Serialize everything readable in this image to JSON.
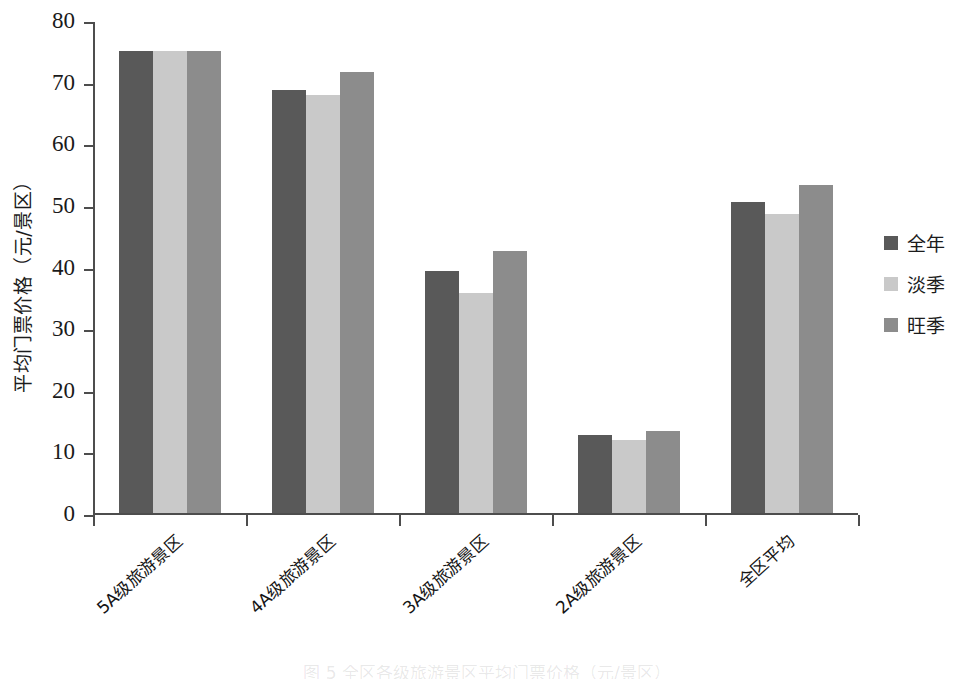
{
  "chart_data": {
    "type": "bar",
    "title": "",
    "xlabel": "",
    "ylabel": "平均门票价格（元/景区）",
    "ylim": [
      0,
      80
    ],
    "ytick_step": 10,
    "yticks": [
      "80",
      "70",
      "60",
      "50",
      "40",
      "30",
      "20",
      "10",
      "0"
    ],
    "grid": false,
    "legend_position": "right",
    "categories": [
      "5A级旅游景区",
      "4A级旅游景区",
      "3A级旅游景区",
      "2A级旅游景区",
      "全区平均"
    ],
    "series": [
      {
        "name": "全年",
        "color": "#595959",
        "values": [
          75.0,
          68.7,
          39.2,
          12.7,
          50.4
        ]
      },
      {
        "name": "淡季",
        "color": "#c9c9c9",
        "values": [
          75.0,
          67.9,
          35.7,
          11.8,
          48.5
        ]
      },
      {
        "name": "旺季",
        "color": "#8c8c8c",
        "values": [
          75.0,
          71.5,
          42.5,
          13.3,
          53.2
        ]
      }
    ],
    "annotations": []
  },
  "legend": {
    "items": [
      {
        "label": "全年",
        "color": "#595959"
      },
      {
        "label": "淡季",
        "color": "#c9c9c9"
      },
      {
        "label": "旺季",
        "color": "#8c8c8c"
      }
    ]
  },
  "caption": {
    "text": "图 5  全区各级旅游景区平均门票价格（元/景区）"
  }
}
